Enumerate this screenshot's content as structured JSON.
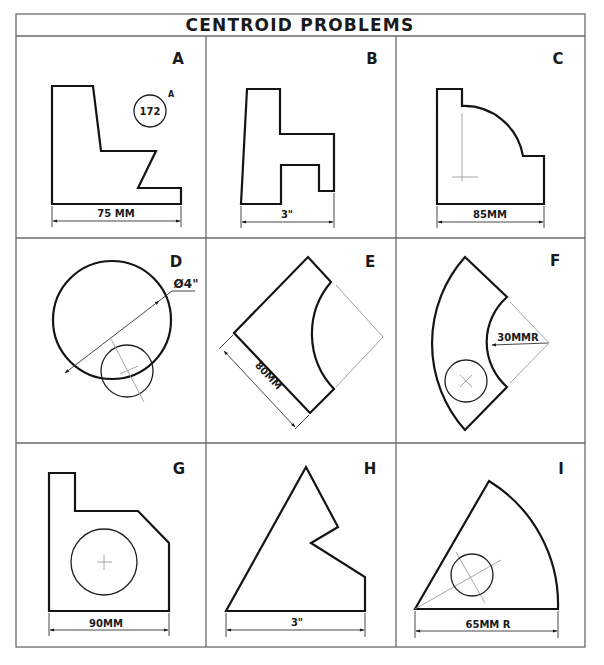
{
  "title": "CENTROID PROBLEMS",
  "colors": {
    "line": "#141414",
    "grid": "#6a6a6a",
    "construction": "#9a9a9a",
    "background": "#ffffff"
  },
  "problems": [
    {
      "letter": "A",
      "dimension": "75 MM",
      "note_circle": "172",
      "note_superscript": "A",
      "shape": "stepped-L-with-notch"
    },
    {
      "letter": "B",
      "dimension": "3\"",
      "shape": "h-profile"
    },
    {
      "letter": "C",
      "dimension": "85MM",
      "shape": "block-with-quarter-arc",
      "has_centroid_mark": true
    },
    {
      "letter": "D",
      "dimension": "Ø4\"",
      "shape": "circle-with-inner-circle"
    },
    {
      "letter": "E",
      "dimension": "80MM",
      "shape": "rotated-square-with-arc-cutout"
    },
    {
      "letter": "F",
      "dimension": "30MMR",
      "shape": "annular-sector-with-hole"
    },
    {
      "letter": "G",
      "dimension": "90MM",
      "shape": "plate-with-chamfer-and-hole"
    },
    {
      "letter": "H",
      "dimension": "3\"",
      "shape": "irregular-triangle-with-notch"
    },
    {
      "letter": "I",
      "dimension": "65MM R",
      "shape": "circular-sector-with-hole"
    }
  ]
}
